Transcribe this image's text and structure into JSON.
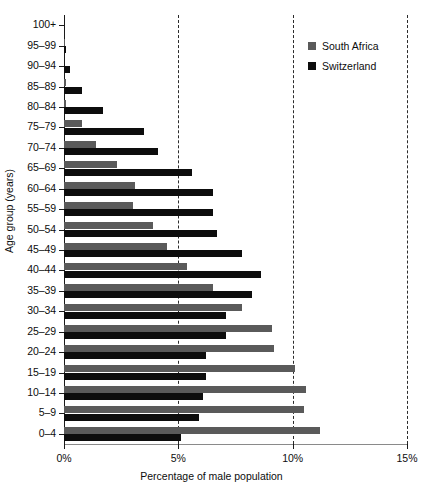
{
  "chart_data": {
    "type": "bar",
    "orientation": "horizontal",
    "title": "",
    "xlabel": "Percentage of male population",
    "ylabel": "Age group (years)",
    "xlim": [
      0,
      15
    ],
    "xticks": [
      0,
      5,
      10,
      15
    ],
    "xtick_labels": [
      "0%",
      "5%",
      "10%",
      "15%"
    ],
    "grid": "vertical-dashed-at-5-10-15",
    "legend_position": "top-right",
    "categories": [
      "100+",
      "95–99",
      "90–94",
      "85–89",
      "80–84",
      "75–79",
      "70–74",
      "65–69",
      "60–64",
      "55–59",
      "50–54",
      "45–49",
      "40–44",
      "35–39",
      "30–34",
      "25–29",
      "20–24",
      "15–19",
      "10–14",
      "5–9",
      "0–4"
    ],
    "series": [
      {
        "name": "South Africa",
        "color": "#5a5a5a",
        "values": [
          0.0,
          0.05,
          0.0,
          0.1,
          0.1,
          0.8,
          1.4,
          2.3,
          3.1,
          3.0,
          3.9,
          4.5,
          5.4,
          6.5,
          7.8,
          9.1,
          9.2,
          10.1,
          10.6,
          10.5,
          11.2
        ]
      },
      {
        "name": "Switzerland",
        "color": "#0d0d0d",
        "values": [
          0.0,
          0.1,
          0.25,
          0.8,
          1.7,
          3.5,
          4.1,
          5.6,
          6.5,
          6.5,
          6.7,
          7.8,
          8.6,
          8.2,
          7.1,
          7.1,
          6.2,
          6.2,
          6.1,
          5.9,
          5.1
        ]
      }
    ],
    "units": "percent"
  },
  "legend": {
    "items": [
      {
        "label": "South Africa",
        "color": "#5a5a5a"
      },
      {
        "label": "Switzerland",
        "color": "#0d0d0d"
      }
    ]
  }
}
